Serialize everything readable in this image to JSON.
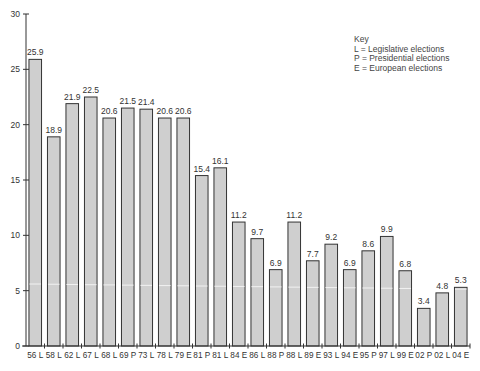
{
  "chart_data": {
    "type": "bar",
    "title": "",
    "xlabel": "",
    "ylabel": "",
    "ylim": [
      0,
      30
    ],
    "yticks": [
      0,
      5,
      10,
      15,
      20,
      25,
      30
    ],
    "grid": false,
    "legend_position": "top-right",
    "categories": [
      "56 L",
      "58 L",
      "62 L",
      "67 L",
      "68 L",
      "69 P",
      "73 L",
      "78 L",
      "79 E",
      "81 P",
      "81 L",
      "84 E",
      "86 L",
      "88 P",
      "88 L",
      "89 E",
      "93 L",
      "94 E",
      "95 P",
      "97 L",
      "99 E",
      "02 P",
      "02 L",
      "04 E"
    ],
    "values": [
      25.9,
      18.9,
      21.9,
      22.5,
      20.6,
      21.5,
      21.4,
      20.6,
      20.6,
      15.4,
      16.1,
      11.2,
      9.7,
      6.9,
      11.2,
      7.7,
      9.2,
      6.9,
      8.6,
      9.9,
      6.8,
      3.4,
      4.8,
      5.3
    ],
    "value_labels": [
      "25.9",
      "18.9",
      "21.9",
      "22.5",
      "20.6",
      "21.5",
      "21.4",
      "20.6",
      "20.6",
      "15.4",
      "16.1",
      "11.2",
      "9.7",
      "6.9",
      "11.2",
      "7.7",
      "9.2",
      "6.9",
      "8.6",
      "9.9",
      "6.8",
      "3.4",
      "4.8",
      "5.3"
    ],
    "colors": {
      "bar_fill": "#cfcfcf",
      "bar_stroke": "#333333",
      "axis": "#333333",
      "highlight_line": "#f2f2f2"
    }
  },
  "key": {
    "title": "Key",
    "entries": [
      "L = Legislative elections",
      "P = Presidential elections",
      "E = European elections"
    ]
  }
}
